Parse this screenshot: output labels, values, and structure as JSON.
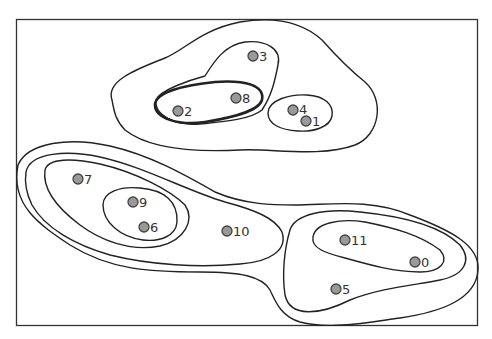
{
  "diagram": {
    "type": "cluster-contour-plot",
    "colors": {
      "node_fill": "#999999",
      "node_stroke": "#444444",
      "contour": "#222222",
      "frame": "#333333",
      "background": "#ffffff"
    },
    "nodes": [
      {
        "id": "0",
        "label": "0"
      },
      {
        "id": "1",
        "label": "1"
      },
      {
        "id": "2",
        "label": "2"
      },
      {
        "id": "3",
        "label": "3"
      },
      {
        "id": "4",
        "label": "4"
      },
      {
        "id": "5",
        "label": "5"
      },
      {
        "id": "6",
        "label": "6"
      },
      {
        "id": "7",
        "label": "7"
      },
      {
        "id": "8",
        "label": "8"
      },
      {
        "id": "9",
        "label": "9"
      },
      {
        "id": "10",
        "label": "10"
      },
      {
        "id": "11",
        "label": "11"
      }
    ],
    "clusters": [
      {
        "name": "top-outer",
        "members": [
          "3",
          "2",
          "8",
          "4",
          "1"
        ]
      },
      {
        "name": "top-3-2-8",
        "members": [
          "3",
          "2",
          "8"
        ]
      },
      {
        "name": "top-2-8",
        "members": [
          "2",
          "8"
        ],
        "emphasized": true
      },
      {
        "name": "top-4-1",
        "members": [
          "4",
          "1"
        ]
      },
      {
        "name": "bottom-outermost",
        "members": [
          "7",
          "9",
          "6",
          "10",
          "11",
          "0",
          "5"
        ]
      },
      {
        "name": "left-outer",
        "members": [
          "7",
          "9",
          "6",
          "10"
        ]
      },
      {
        "name": "left-7-9-6",
        "members": [
          "7",
          "9",
          "6"
        ]
      },
      {
        "name": "left-9-6",
        "members": [
          "9",
          "6"
        ]
      },
      {
        "name": "right-outer",
        "members": [
          "11",
          "0",
          "5"
        ]
      },
      {
        "name": "right-11-0",
        "members": [
          "11",
          "0"
        ]
      }
    ]
  }
}
